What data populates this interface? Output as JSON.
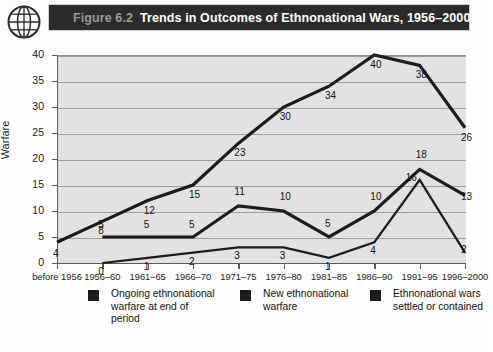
{
  "figure": {
    "number": "Figure 6.2",
    "title": "Trends in Outcomes of Ethnonational Wars, 1956–2000",
    "icon": "globe-icon"
  },
  "chart_data": {
    "type": "line",
    "title": "Trends in Outcomes of Ethnonational Wars, 1956–2000",
    "xlabel": "",
    "ylabel": "Warfare",
    "ylim": [
      0,
      40
    ],
    "yticks": [
      0,
      5,
      10,
      15,
      20,
      25,
      30,
      35,
      40
    ],
    "grid": true,
    "legend_position": "bottom",
    "categories": [
      "before 1956",
      "1956–60",
      "1961–65",
      "1966–70",
      "1971–75",
      "1976–80",
      "1981–85",
      "1986–90",
      "1991–95",
      "1996–2000"
    ],
    "series": [
      {
        "name": "Ongoing ethnonational warfare at end of period",
        "color": "#1c1c1c",
        "values": [
          4,
          8,
          12,
          15,
          23,
          30,
          34,
          40,
          38,
          26
        ]
      },
      {
        "name": "New ethnonational warfare",
        "color": "#1c1c1c",
        "values": [
          null,
          5,
          5,
          5,
          11,
          10,
          5,
          10,
          18,
          13
        ]
      },
      {
        "name": "Ethnonational wars settled or contained",
        "color": "#1c1c1c",
        "values": [
          null,
          0,
          1,
          2,
          3,
          3,
          1,
          4,
          16,
          2
        ]
      }
    ]
  },
  "legend": {
    "items": [
      {
        "label": "Ongoing ethnonational warfare at end of period",
        "color": "#1c1c1c"
      },
      {
        "label": "New ethnonational warfare",
        "color": "#1c1c1c"
      },
      {
        "label": "Ethnonational wars settled or contained",
        "color": "#1c1c1c"
      }
    ]
  }
}
